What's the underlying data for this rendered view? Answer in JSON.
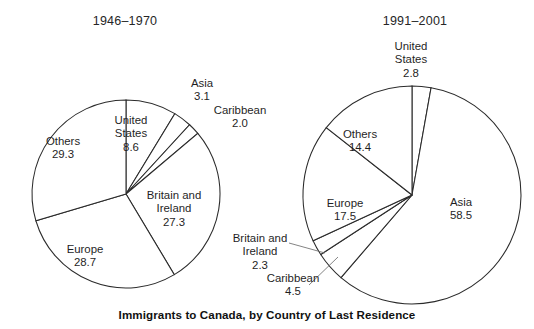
{
  "caption": "Immigrants to Canada, by Country of Last Residence",
  "chart_data": [
    {
      "type": "pie",
      "title": "1946–1970",
      "categories": [
        "United States",
        "Asia",
        "Caribbean",
        "Britain and Ireland",
        "Europe",
        "Others"
      ],
      "values": [
        8.6,
        3.1,
        2.0,
        27.3,
        28.7,
        29.3
      ],
      "unit": "percent",
      "start_angle_deg": 0,
      "direction": "clockwise",
      "xlabel": "",
      "ylabel": "",
      "legend": "none",
      "grid": false
    },
    {
      "type": "pie",
      "title": "1991–2001",
      "categories": [
        "United States",
        "Asia",
        "Caribbean",
        "Britain and Ireland",
        "Europe",
        "Others"
      ],
      "values": [
        2.8,
        58.5,
        4.5,
        2.3,
        17.5,
        14.4
      ],
      "unit": "percent",
      "start_angle_deg": 0,
      "direction": "clockwise",
      "xlabel": "",
      "ylabel": "",
      "legend": "none",
      "grid": false
    }
  ],
  "left_chart": {
    "title": "1946–1970",
    "labels": [
      {
        "name": "United States",
        "value": "8.6",
        "x": 104,
        "y": 114,
        "w": 54
      },
      {
        "name": "Asia",
        "value": "3.1",
        "x": 181,
        "y": 77,
        "w": 42
      },
      {
        "name": "Caribbean",
        "value": "2.0",
        "x": 209,
        "y": 104,
        "w": 62
      },
      {
        "name": "Britain and Ireland",
        "value": "27.3",
        "x": 143,
        "y": 189,
        "w": 62
      },
      {
        "name": "Europe",
        "value": "28.7",
        "x": 59,
        "y": 243,
        "w": 52
      },
      {
        "name": "Others",
        "value": "29.3",
        "x": 36,
        "y": 135,
        "w": 54
      }
    ]
  },
  "right_chart": {
    "title": "1991–2001",
    "labels": [
      {
        "name": "United States",
        "value": "2.8",
        "x": 382,
        "y": 40,
        "w": 58
      },
      {
        "name": "Asia",
        "value": "58.5",
        "x": 440,
        "y": 196,
        "w": 42
      },
      {
        "name": "Caribbean",
        "value": "4.5",
        "x": 262,
        "y": 272,
        "w": 62
      },
      {
        "name": "Britain and Ireland",
        "value": "2.3",
        "x": 231,
        "y": 232,
        "w": 58
      },
      {
        "name": "Europe",
        "value": "17.5",
        "x": 319,
        "y": 197,
        "w": 52
      },
      {
        "name": "Others",
        "value": "14.4",
        "x": 334,
        "y": 128,
        "w": 52
      }
    ]
  },
  "geometry": {
    "left": {
      "cx": 126,
      "cy": 194,
      "r": 94
    },
    "right": {
      "cx": 412,
      "cy": 195,
      "r": 109
    }
  },
  "colors": {
    "background": "#ffffff",
    "slice_fill": "#ffffff",
    "stroke": "#2b2b2b",
    "text": "#1f1f1f",
    "leader": "#6e6e6e"
  }
}
